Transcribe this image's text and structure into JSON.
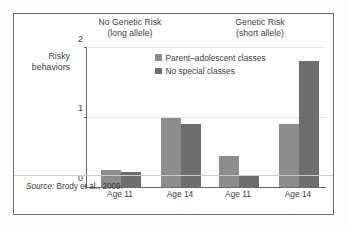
{
  "figure": {
    "source_label": "Source:",
    "source_text": "Brody et al., 2009."
  },
  "chart_data": {
    "type": "bar",
    "title": "",
    "xlabel": "",
    "ylabel": "Risky behaviors",
    "ylabel_line1": "Risky",
    "ylabel_line2": "behaviors",
    "ylim": [
      0,
      2
    ],
    "yticks": [
      0,
      1,
      2
    ],
    "ytick_labels": [
      "0",
      "1",
      "2"
    ],
    "grid": true,
    "gridlines_at": [
      1,
      2
    ],
    "legend_position": "inside-top-center",
    "categories": [
      "Age 11",
      "Age 14",
      "Age 11",
      "Age 14"
    ],
    "groups": [
      {
        "label_line1": "No Genetic Risk",
        "label_line2": "(long allele)",
        "categories": [
          "Age 11",
          "Age 14"
        ]
      },
      {
        "label_line1": "Genetic Risk",
        "label_line2": "(short allele)",
        "categories": [
          "Age 11",
          "Age 14"
        ]
      }
    ],
    "series": [
      {
        "name": "Parent–adolescent classes",
        "color": "#8d8d8d",
        "values": [
          0.25,
          1.0,
          0.45,
          0.9
        ]
      },
      {
        "name": "No special classes",
        "color": "#6e6e6e",
        "values": [
          0.22,
          0.9,
          0.17,
          1.82
        ]
      }
    ],
    "axis_color": "#6b6b6b",
    "grid_color": "#e3e3e3"
  }
}
